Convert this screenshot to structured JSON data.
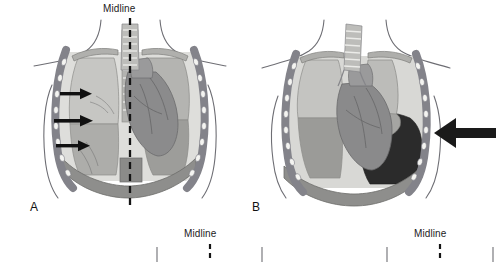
{
  "figure": {
    "kind": "medical-illustration",
    "background_color": "#ffffff",
    "panels": [
      {
        "id": "A",
        "letter": "A",
        "midline_label": "Midline",
        "has_midline": true,
        "description": "normal chest with trachea at midline, three arrows indicating inward pressure on the left hemithorax",
        "arrow_count": 3,
        "arrow_direction": "right",
        "arrow_color": "#111111"
      },
      {
        "id": "B",
        "letter": "B",
        "midline_label": "",
        "has_midline": false,
        "description": "chest with collapsed lung and dark pleural air collection, single large arrow pressing inward from the right",
        "arrow_count": 1,
        "arrow_direction": "left",
        "arrow_color": "#1a1a1a"
      },
      {
        "id": "C",
        "letter": "",
        "midline_label": "Midline",
        "has_midline": true,
        "description": "top edge of lower-row panel, cropped"
      },
      {
        "id": "D",
        "letter": "",
        "midline_label": "Midline",
        "has_midline": true,
        "description": "top edge of lower-row panel, cropped"
      }
    ]
  },
  "palette": {
    "background": "#ffffff",
    "outline": "#55545a",
    "body_contour": "#6a6a70",
    "rib_band": "#8a8a8e",
    "rib_segment": "#f2f2f0",
    "lung_upper": "#bfbfbc",
    "lung_lower": "#a3a3a1",
    "lung_light": "#d2d2cf",
    "heart": "#8e8e8f",
    "heart_dark": "#7b7b7c",
    "trachea": "#b9b9b6",
    "trachea_ring": "#e8e8e5",
    "diaphragm": "#9a9a98",
    "pleural_space_dark": "#2a2a2a",
    "dashed_midline": "#141414",
    "text": "#1b1b1b"
  }
}
